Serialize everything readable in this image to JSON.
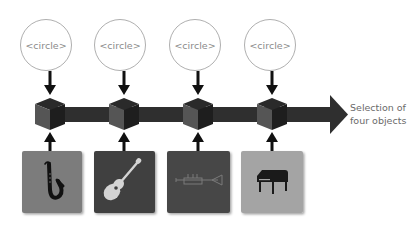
{
  "diagram": {
    "circles": [
      {
        "label": "<circle>",
        "cx": 46,
        "cy": 45
      },
      {
        "label": "<circle>",
        "cx": 120,
        "cy": 45
      },
      {
        "label": "<circle>",
        "cx": 195,
        "cy": 45
      },
      {
        "label": "<circle>",
        "cx": 270,
        "cy": 45
      }
    ],
    "objects": [
      {
        "name": "saxophone",
        "icon": "saxophone-icon",
        "color": "#7b7b7b",
        "icon_color": "#111111"
      },
      {
        "name": "guitar",
        "icon": "guitar-icon",
        "color": "#3f3f3f",
        "icon_color": "#d4d4d4"
      },
      {
        "name": "trumpet",
        "icon": "trumpet-icon",
        "color": "#474747",
        "icon_color": "#777777"
      },
      {
        "name": "piano",
        "icon": "piano-icon",
        "color": "#a4a4a4",
        "icon_color": "#1a1a1a"
      }
    ],
    "arrow_color": "#2f2f2f",
    "cube_color": "#333333",
    "caption": {
      "line1": "Selection of",
      "line2": "four objects"
    }
  }
}
